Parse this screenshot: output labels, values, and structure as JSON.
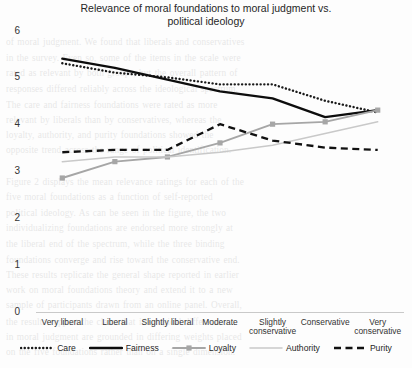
{
  "chart_data": {
    "type": "line",
    "title": "Relevance of moral foundations to moral judgment vs. political ideology",
    "title_line1": "Relevance of moral foundations to moral judgment vs.",
    "title_line2": "political ideology",
    "xlabel": "",
    "ylabel": "",
    "ylim": [
      0,
      6
    ],
    "yticks": [
      "6",
      "5",
      "4",
      "3",
      "2",
      "1",
      "0"
    ],
    "grid": false,
    "legend_position": "bottom",
    "categories": [
      "Very liberal",
      "Liberal",
      "Slightly liberal",
      "Moderate",
      "Slightly conservative",
      "Conservative",
      "Very conservative"
    ],
    "category_lines": [
      [
        "Very liberal"
      ],
      [
        "Liberal"
      ],
      [
        "Slightly liberal"
      ],
      [
        "Moderate"
      ],
      [
        "Slightly",
        "conservative"
      ],
      [
        "Conservative"
      ],
      [
        "Very",
        "conservative"
      ]
    ],
    "series": [
      {
        "name": "Care",
        "style": "dotted",
        "color": "#1a1a1a",
        "values": [
          5.3,
          5.1,
          5.0,
          4.85,
          4.85,
          4.5,
          4.25
        ]
      },
      {
        "name": "Fairness",
        "style": "solid-thick",
        "color": "#0d0d0d",
        "values": [
          5.4,
          5.2,
          4.95,
          4.7,
          4.55,
          4.15,
          4.3
        ]
      },
      {
        "name": "Loyalty",
        "style": "solid-marker",
        "color": "#a6a6a6",
        "values": [
          2.85,
          3.2,
          3.3,
          3.6,
          4.0,
          4.05,
          4.3
        ]
      },
      {
        "name": "Authority",
        "style": "solid-thin",
        "color": "#c9c9c9",
        "values": [
          3.2,
          3.3,
          3.3,
          3.4,
          3.55,
          3.8,
          4.05
        ]
      },
      {
        "name": "Purity",
        "style": "dashed",
        "color": "#111111",
        "values": [
          3.4,
          3.45,
          3.45,
          4.0,
          3.65,
          3.5,
          3.45
        ]
      }
    ]
  },
  "legend": {
    "items": [
      "Care",
      "Fairness",
      "Loyalty",
      "Authority",
      "Purity"
    ]
  },
  "background_text": {
    "lines": [
      "of moral judgment. We found that liberals and conservatives",
      "in the survey. Even so, some of the items in the scale were",
      "rated as relevant by both groups, but the overall pattern of",
      "responses differed reliably across the ideological spectrum.",
      "The care and fairness foundations were rated as more",
      "relevant by liberals than by conservatives, whereas the",
      "loyalty, authority, and purity foundations showed the",
      "opposite trend across the range of political identification.",
      "",
      "Figure 2 displays the mean relevance ratings for each of the",
      "five moral foundations as a function of self-reported",
      "political ideology. As can be seen in the figure, the two",
      "individualizing foundations are endorsed more strongly at",
      "the liberal end of the spectrum, while the three binding",
      "foundations converge and rise toward the conservative end.",
      "These results replicate the general shape reported in earlier",
      "work on moral foundations theory and extend it to a new",
      "sample of participants drawn from an online panel. Overall,",
      "the results support the claim that ideological differences",
      "in moral judgment are grounded in differing weights placed",
      "on the five foundations rather than on a single dimension."
    ]
  }
}
